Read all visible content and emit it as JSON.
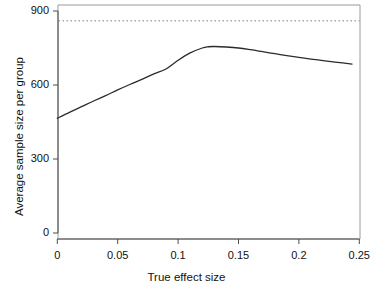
{
  "chart_data": {
    "type": "line",
    "title": "",
    "xlabel": "True effect size",
    "ylabel": "Average sample size per group",
    "xlim": [
      0,
      0.25
    ],
    "ylim": [
      0,
      900
    ],
    "xticks": [
      0,
      0.05,
      0.1,
      0.15,
      0.2,
      0.25
    ],
    "xticklabels": [
      "0",
      "0.05",
      "0.1",
      "0.15",
      "0.2",
      "0.25"
    ],
    "yticks": [
      0,
      300,
      600,
      900
    ],
    "yticklabels": [
      "0",
      "300",
      "600",
      "900"
    ],
    "grid": false,
    "legend": null,
    "box": "open-top-right-frame",
    "series": [
      {
        "name": "Average sample size per group",
        "style": "solid",
        "color": "#2b2b2b",
        "linewidth": 1.3,
        "x": [
          0.0,
          0.01,
          0.02,
          0.03,
          0.04,
          0.05,
          0.06,
          0.07,
          0.08,
          0.09,
          0.1,
          0.11,
          0.12,
          0.125,
          0.13,
          0.14,
          0.15,
          0.16,
          0.17,
          0.18,
          0.19,
          0.2,
          0.21,
          0.22,
          0.23,
          0.244
        ],
        "y": [
          465,
          489,
          512,
          535,
          557,
          580,
          602,
          623,
          645,
          665,
          700,
          730,
          750,
          755,
          756,
          754,
          750,
          743,
          735,
          727,
          719,
          712,
          705,
          699,
          693,
          685
        ]
      }
    ],
    "reference_lines": [
      {
        "name": "fixed-sample-size-reference",
        "orientation": "horizontal",
        "value": 860,
        "style": "dotted",
        "color": "#7a7a7a",
        "linewidth": 1
      }
    ],
    "annotations": []
  }
}
